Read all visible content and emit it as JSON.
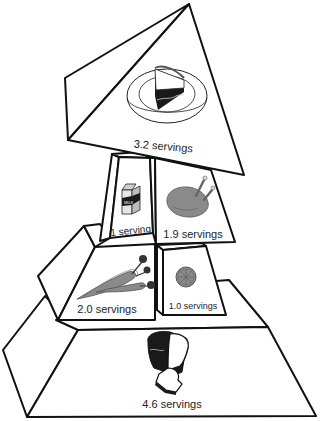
{
  "diagram": {
    "type": "food-pyramid",
    "tiers": [
      {
        "id": "fats-sweets",
        "food": "cake",
        "label": "3.2 servings"
      },
      {
        "id": "milk",
        "food": "milk-carton",
        "label": "1 serving"
      },
      {
        "id": "meat",
        "food": "chicken",
        "label": "1.9 servings"
      },
      {
        "id": "vegetables",
        "food": "carrots",
        "label": "2.0 servings"
      },
      {
        "id": "fruit",
        "food": "orange-slice",
        "label": "1.0 servings"
      },
      {
        "id": "grains",
        "food": "bread",
        "label": "4.6 servings"
      }
    ],
    "colors": {
      "outline": "#111111",
      "fill": "#ffffff",
      "icon_gray": "#8a8a8a",
      "icon_dark": "#1a1a1a"
    }
  }
}
